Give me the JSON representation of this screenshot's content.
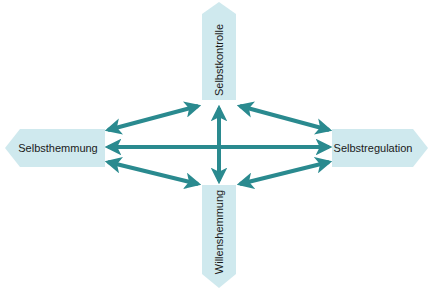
{
  "diagram": {
    "nodes": {
      "top": {
        "label": "Selbstkontrolle",
        "orientation": "vertical"
      },
      "left": {
        "label": "Selbsthemmung",
        "orientation": "horizontal"
      },
      "right": {
        "label": "Selbstregulation",
        "orientation": "horizontal"
      },
      "bottom": {
        "label": "Willenshemmung",
        "orientation": "vertical"
      }
    },
    "edges": [
      {
        "from": "Selbsthemmung",
        "to": "Selbstkontrolle",
        "type": "bidirectional"
      },
      {
        "from": "Selbstkontrolle",
        "to": "Selbstregulation",
        "type": "bidirectional"
      },
      {
        "from": "Selbsthemmung",
        "to": "Selbstregulation",
        "type": "bidirectional"
      },
      {
        "from": "Selbstkontrolle",
        "to": "Willenshemmung",
        "type": "bidirectional"
      },
      {
        "from": "Selbsthemmung",
        "to": "Willenshemmung",
        "type": "bidirectional"
      },
      {
        "from": "Willenshemmung",
        "to": "Selbstregulation",
        "type": "bidirectional"
      }
    ],
    "colors": {
      "node_fill": "#cfe9ee",
      "arrow": "#2a8a8f",
      "text": "#1a1a1a"
    }
  }
}
